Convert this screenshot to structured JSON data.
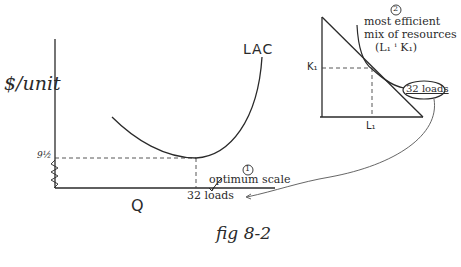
{
  "figure": {
    "caption": "fig 8-2",
    "left_panel": {
      "y_axis_label": "$/unit",
      "x_axis_label": "Q",
      "curve_label": "LAC",
      "y_tick": "9½",
      "x_tick": "32 loads",
      "annotation_number": "①",
      "annotation_text": "optimum scale"
    },
    "right_panel": {
      "y_tick": "K₁",
      "x_tick": "L₁",
      "annotation_number": "②",
      "annotation_line1": "most efficient",
      "annotation_line2": "mix of resources",
      "annotation_line3": "(L₁ ⁱ K₁)",
      "isoquant_label": "32 loads"
    }
  },
  "colors": {
    "ink": "#2a2a2a",
    "background": "#ffffff"
  }
}
